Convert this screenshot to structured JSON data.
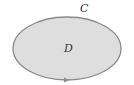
{
  "diagram": {
    "region_label": "D",
    "curve_label": "C",
    "colors": {
      "fill": "#dedede",
      "stroke": "#8a8a8a",
      "text": "#333333",
      "arrow": "#8a8a8a"
    },
    "orientation": "counterclockwise arrow at bottom"
  }
}
